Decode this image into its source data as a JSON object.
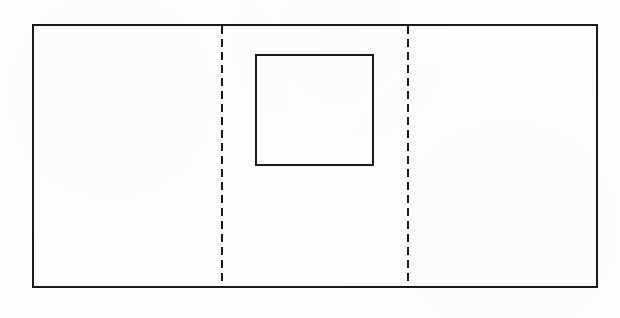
{
  "figure": {
    "type": "line-drawing",
    "background_color": "#fefefe",
    "stroke_color": "#1a1a1a",
    "canvas": {
      "width": 620,
      "height": 318
    },
    "outer_rectangle": {
      "name": "outer-rectangle",
      "x": 33,
      "y": 25,
      "width": 564,
      "height": 262,
      "stroke_width": 2.4,
      "stroke_style": "solid",
      "fill": "none"
    },
    "inner_square": {
      "name": "inner-square",
      "x": 256,
      "y": 55,
      "width": 117,
      "height": 110,
      "stroke_width": 2.4,
      "stroke_style": "solid",
      "fill": "none"
    },
    "dashed_lines": [
      {
        "name": "left-fold-line",
        "orientation": "vertical",
        "x": 222,
        "y1": 26,
        "y2": 286,
        "stroke_width": 2.2,
        "stroke_style": "dashed",
        "dash": 8,
        "gap": 5
      },
      {
        "name": "right-fold-line",
        "orientation": "vertical",
        "x": 408,
        "y1": 26,
        "y2": 286,
        "stroke_width": 2.2,
        "stroke_style": "dashed",
        "dash": 8,
        "gap": 5
      }
    ],
    "panels": [
      {
        "name": "left-panel",
        "x": 33,
        "width": 189
      },
      {
        "name": "center-panel",
        "x": 222,
        "width": 186
      },
      {
        "name": "right-panel",
        "x": 408,
        "width": 189
      }
    ],
    "labels": []
  }
}
